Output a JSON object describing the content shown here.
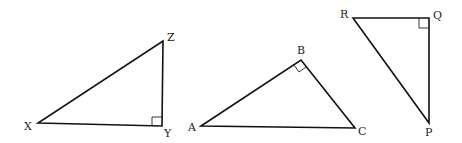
{
  "diagram": {
    "background": "#ffffff",
    "stroke_color": "#111111",
    "triangles": [
      {
        "name": "XYZ",
        "right_angle_at": "Y",
        "vertices": [
          {
            "label": "X",
            "x": 38,
            "y": 123
          },
          {
            "label": "Y",
            "x": 162,
            "y": 126
          },
          {
            "label": "Z",
            "x": 163,
            "y": 41
          }
        ]
      },
      {
        "name": "ABC",
        "right_angle_at": "B",
        "vertices": [
          {
            "label": "A",
            "x": 201,
            "y": 126
          },
          {
            "label": "B",
            "x": 301,
            "y": 60
          },
          {
            "label": "C",
            "x": 355,
            "y": 128
          }
        ]
      },
      {
        "name": "PQR",
        "right_angle_at": "Q",
        "vertices": [
          {
            "label": "R",
            "x": 353,
            "y": 18
          },
          {
            "label": "Q",
            "x": 429,
            "y": 18
          },
          {
            "label": "P",
            "x": 429,
            "y": 123
          }
        ]
      }
    ]
  },
  "labels": {
    "X": "X",
    "Y": "Y",
    "Z": "Z",
    "A": "A",
    "B": "B",
    "C": "C",
    "P": "P",
    "Q": "Q",
    "R": "R"
  }
}
